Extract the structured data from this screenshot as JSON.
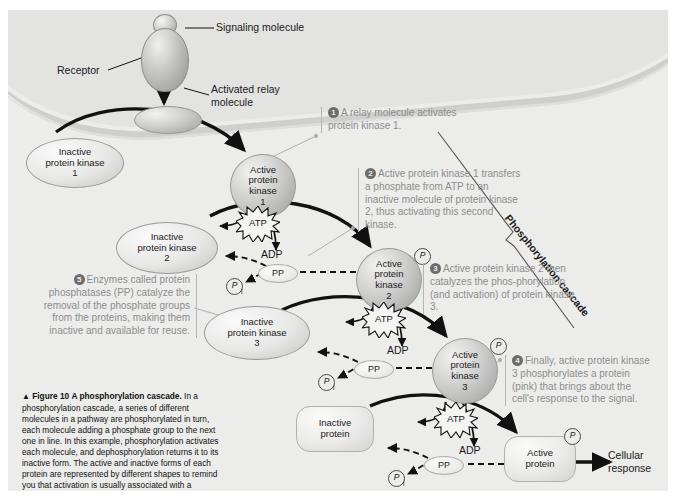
{
  "figure": {
    "number_label": "Figure 10",
    "title": "A phosphorylation cascade.",
    "caption_body": " In a phosphorylation cascade, a series of different molecules in a pathway are phosphorylated in turn, each molecule adding a phosphate group to the next one in line. In this example, phosphorylation activates each molecule, and dephosphorylation returns it to its inactive form. The active and inactive forms of each protein are represented by different shapes to remind you that activation is usually associated with a change in molecular shape.",
    "triangle_marker": "▲"
  },
  "labels": {
    "signaling_molecule": "Signaling molecule",
    "receptor": "Receptor",
    "activated_relay": "Activated relay\nmolecule",
    "cascade_axis": "Phosphorylation cascade",
    "cellular_response": "Cellular\nresponse"
  },
  "molecules": {
    "inactive_kinase_1": "Inactive\nprotein kinase\n1",
    "active_kinase_1": "Active\nprotein\nkinase\n1",
    "inactive_kinase_2": "Inactive\nprotein kinase\n2",
    "active_kinase_2": "Active\nprotein\nkinase\n2",
    "inactive_kinase_3": "Inactive\nprotein kinase\n3",
    "active_kinase_3": "Active\nprotein\nkinase\n3",
    "inactive_protein": "Inactive\nprotein",
    "active_protein": "Active\nprotein"
  },
  "energy": {
    "atp": "ATP",
    "adp": "ADP",
    "pp": "PP",
    "phosphate": "P",
    "phosphate_sub": "i"
  },
  "callouts": [
    {
      "num": "1",
      "text": "A relay molecule activates protein kinase 1."
    },
    {
      "num": "2",
      "text": "Active protein kinase 1 transfers a phosphate from ATP to an inactive molecule of protein kinase 2, thus activating this second kinase."
    },
    {
      "num": "3",
      "text": "Active protein kinase 2 then catalyzes the phos-phorylation (and activation) of protein kinase 3."
    },
    {
      "num": "4",
      "text": "Finally, active protein kinase 3 phosphorylates a protein (pink) that brings about the cell's response to the signal."
    },
    {
      "num": "5",
      "text": "Enzymes called protein phosphatases (PP) catalyze the removal of the phosphate groups from the proteins, making them inactive and available for reuse."
    }
  ],
  "colors": {
    "panel_bg": "#ececeb",
    "callout_text": "#8d8d8d",
    "outline": "#1a1a1a",
    "membrane": "#cfcfce"
  }
}
